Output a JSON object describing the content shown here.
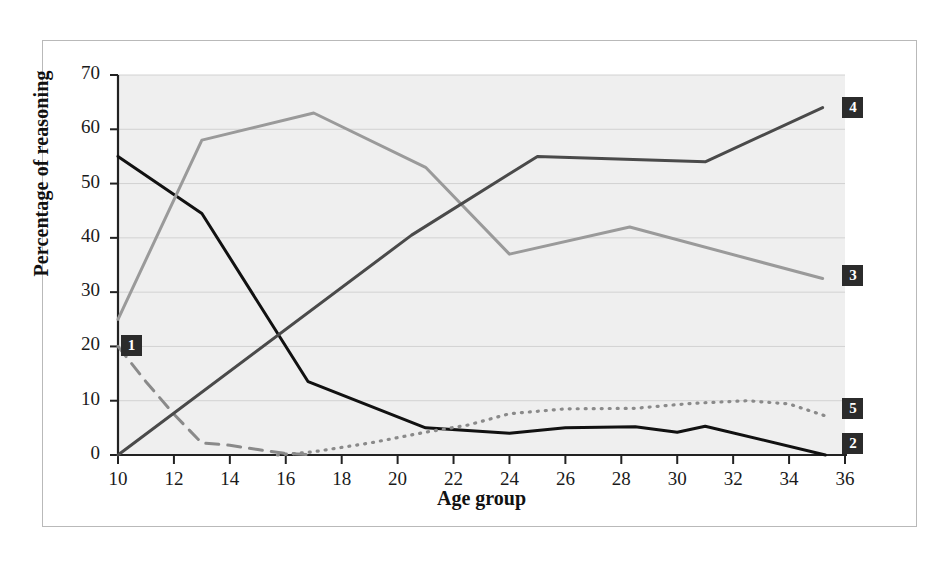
{
  "figure": {
    "background_color": "#ffffff",
    "frame_border_color": "#b9b9b9",
    "plot_background_color": "#efefef"
  },
  "chart_data": {
    "type": "line",
    "title": "",
    "xlabel": "Age group",
    "ylabel": "Percentage of reasoning",
    "xlim": [
      10,
      36
    ],
    "ylim": [
      0,
      70
    ],
    "xticks": [
      10,
      12,
      14,
      16,
      18,
      20,
      22,
      24,
      26,
      28,
      30,
      32,
      34,
      36
    ],
    "yticks": [
      0,
      10,
      20,
      30,
      40,
      50,
      60,
      70
    ],
    "grid": "horizontal",
    "legend_position": "line-end-labels",
    "series": [
      {
        "name": "1",
        "label": "1",
        "style": "dashed",
        "color": "#8a8a8a",
        "width": 3.0,
        "label_x": 10.0,
        "label_y": 20.0,
        "points": [
          [
            10,
            20
          ],
          [
            11,
            13.5
          ],
          [
            12,
            7.5
          ],
          [
            13,
            2.2
          ],
          [
            14,
            1.8
          ],
          [
            15,
            1.0
          ],
          [
            16,
            0.3
          ],
          [
            17,
            0
          ]
        ]
      },
      {
        "name": "2",
        "label": "2",
        "style": "solid",
        "color": "#111111",
        "width": 3.0,
        "label_x": 35.8,
        "label_y": 2.0,
        "points": [
          [
            10,
            55
          ],
          [
            13,
            44.5
          ],
          [
            16.8,
            13.5
          ],
          [
            21,
            5
          ],
          [
            24,
            4
          ],
          [
            26,
            5
          ],
          [
            28.5,
            5.2
          ],
          [
            30,
            4.2
          ],
          [
            31,
            5.3
          ],
          [
            35.3,
            0
          ]
        ]
      },
      {
        "name": "3",
        "label": "3",
        "style": "solid",
        "color": "#9a9a9a",
        "width": 3.0,
        "label_x": 35.8,
        "label_y": 33.0,
        "points": [
          [
            10,
            25
          ],
          [
            13,
            58
          ],
          [
            17,
            63
          ],
          [
            21,
            53
          ],
          [
            24,
            37
          ],
          [
            28.3,
            42
          ],
          [
            35.2,
            32.5
          ]
        ]
      },
      {
        "name": "4",
        "label": "4",
        "style": "solid",
        "color": "#4a4a4a",
        "width": 3.0,
        "label_x": 35.8,
        "label_y": 64.0,
        "points": [
          [
            10,
            0
          ],
          [
            20.5,
            40.5
          ],
          [
            25,
            55
          ],
          [
            31,
            54
          ],
          [
            35.2,
            64
          ]
        ]
      },
      {
        "name": "5",
        "label": "5",
        "style": "dotted",
        "color": "#8a8a8a",
        "width": 3.2,
        "label_x": 35.8,
        "label_y": 8.5,
        "points": [
          [
            15.7,
            0
          ],
          [
            17,
            0.6
          ],
          [
            19,
            2.2
          ],
          [
            21,
            4.2
          ],
          [
            22.5,
            5.5
          ],
          [
            24,
            7.6
          ],
          [
            26,
            8.5
          ],
          [
            28.5,
            8.6
          ],
          [
            30.5,
            9.5
          ],
          [
            32.5,
            10
          ],
          [
            34,
            9.4
          ],
          [
            35.3,
            7.2
          ]
        ]
      }
    ]
  }
}
